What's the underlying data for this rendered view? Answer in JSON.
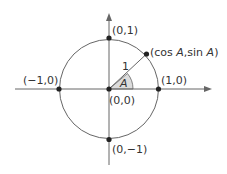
{
  "diagram": {
    "colors": {
      "line": "#555555",
      "point": "#222222",
      "wedge": "#d9d9d9",
      "text": "#333333"
    },
    "labels": {
      "top": "(0,1)",
      "bottom": "(0,−1)",
      "left": "(−1,0)",
      "right": "(1,0)",
      "origin": "(0,0)",
      "radius": "1",
      "angle": "A",
      "point_prefix": "(cos ",
      "point_a1": "A",
      "point_mid": ",sin ",
      "point_a2": "A",
      "point_suffix": ")"
    }
  }
}
